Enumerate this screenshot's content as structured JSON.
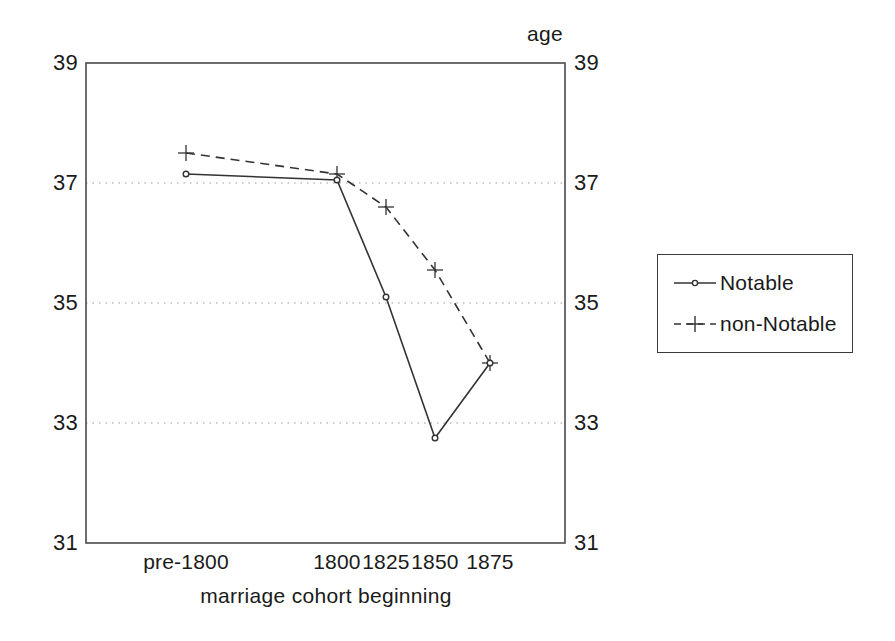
{
  "chart_data": {
    "type": "line",
    "title": "",
    "subtitle": "",
    "xlabel": "marriage cohort beginning",
    "ylabel": "age",
    "ylabel_position": "top-right",
    "categories": [
      "pre-1800",
      "1800",
      "1825",
      "1850",
      "1875"
    ],
    "x_positions": [
      1790,
      1800,
      1825,
      1850,
      1875
    ],
    "xlim": [
      1786,
      1884
    ],
    "ylim": [
      31,
      39
    ],
    "y_ticks": [
      31,
      33,
      35,
      37,
      39
    ],
    "y_ticks_both_sides": true,
    "gridlines": {
      "horizontal_values": [
        33,
        35,
        37
      ],
      "style": "dotted",
      "vertical": false
    },
    "legend_position": "right-outside",
    "series": [
      {
        "name": "Notable",
        "line_style": "solid",
        "marker": "circle",
        "color": "#333333",
        "values": [
          37.15,
          37.05,
          35.1,
          32.75,
          34.0
        ]
      },
      {
        "name": "non-Notable",
        "line_style": "dashed",
        "marker": "plus",
        "color": "#333333",
        "values": [
          37.5,
          37.15,
          36.6,
          35.55,
          34.0
        ]
      }
    ]
  },
  "axes": {
    "y_label": "age",
    "x_label": "marriage cohort beginning",
    "y_tick_labels": [
      "39",
      "37",
      "35",
      "33",
      "31"
    ],
    "x_tick_labels": [
      "pre-1800",
      "1800",
      "1825",
      "1850",
      "1875"
    ]
  },
  "legend": {
    "entries": [
      {
        "label": "Notable",
        "marker": "circle-marker",
        "line": "solid-line"
      },
      {
        "label": "non-Notable",
        "marker": "plus-marker",
        "line": "dashed-line"
      }
    ]
  },
  "colors": {
    "ink": "#333333",
    "grid": "#9a9a9a",
    "frame": "#4a4a4a",
    "background": "#ffffff"
  }
}
